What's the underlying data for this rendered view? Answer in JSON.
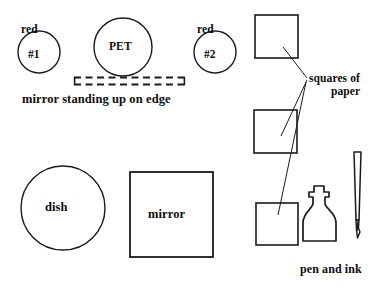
{
  "diagram": {
    "stroke_color": "#1a1a1a",
    "fill_color": "#ffffff",
    "background": "#ffffff",
    "items": {
      "red_sample_1": {
        "outside_label": "red",
        "inside_label": "#1",
        "shape": "circle"
      },
      "pet_sample": {
        "inside_label": "PET",
        "shape": "circle"
      },
      "red_sample_2": {
        "outside_label": "red",
        "inside_label": "#2",
        "shape": "circle"
      },
      "standing_mirror": {
        "label": "mirror standing up on edge",
        "shape": "dashed-rectangle"
      },
      "dish": {
        "inside_label": "dish",
        "shape": "circle"
      },
      "flat_mirror": {
        "inside_label": "mirror",
        "shape": "square"
      },
      "paper_squares": {
        "label_line_1": "squares of",
        "label_line_2": "paper",
        "count": 3,
        "shape": "square"
      },
      "pen_and_ink": {
        "label": "pen and ink",
        "parts": [
          "ink-bottle",
          "dip-pen"
        ]
      }
    }
  }
}
